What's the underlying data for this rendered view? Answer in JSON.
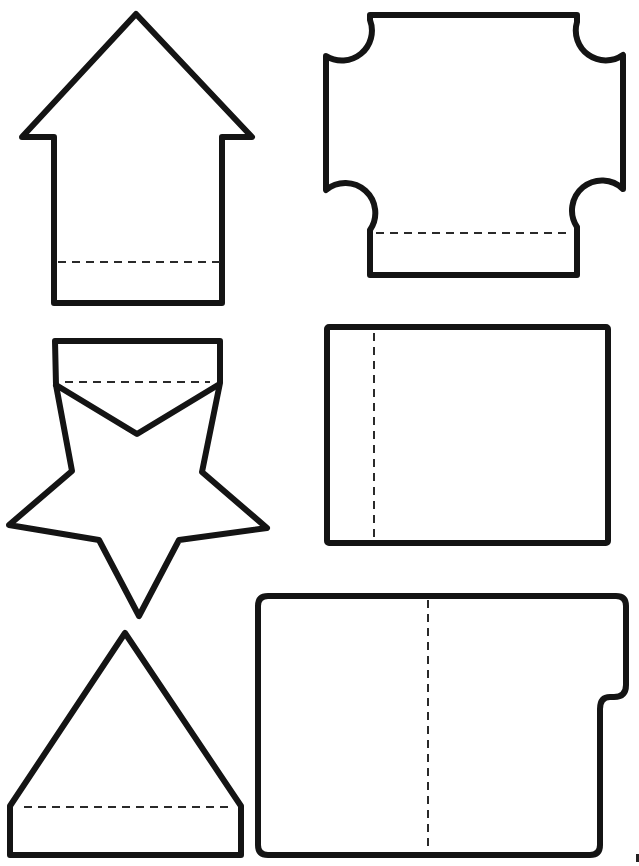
{
  "page": {
    "kind": "printable cut-out template",
    "background": "#ffffff",
    "outline_color": "#141414",
    "fold_line_color": "#2a2a2a"
  },
  "shapes": [
    {
      "id": "house",
      "name": "House / arrow shape",
      "fold_line": "horizontal",
      "position": "top-left"
    },
    {
      "id": "ticket",
      "name": "Scalloped-corner ticket shape",
      "fold_line": "horizontal",
      "position": "top-right"
    },
    {
      "id": "star",
      "name": "Star with top flap",
      "fold_line": "horizontal",
      "position": "middle-left"
    },
    {
      "id": "card",
      "name": "Rectangle card",
      "fold_line": "vertical",
      "position": "middle-right"
    },
    {
      "id": "triangle",
      "name": "Triangle / tent shape",
      "fold_line": "horizontal",
      "position": "bottom-left"
    },
    {
      "id": "folder",
      "name": "Folder with tab",
      "fold_line": "vertical",
      "position": "bottom-right"
    }
  ]
}
